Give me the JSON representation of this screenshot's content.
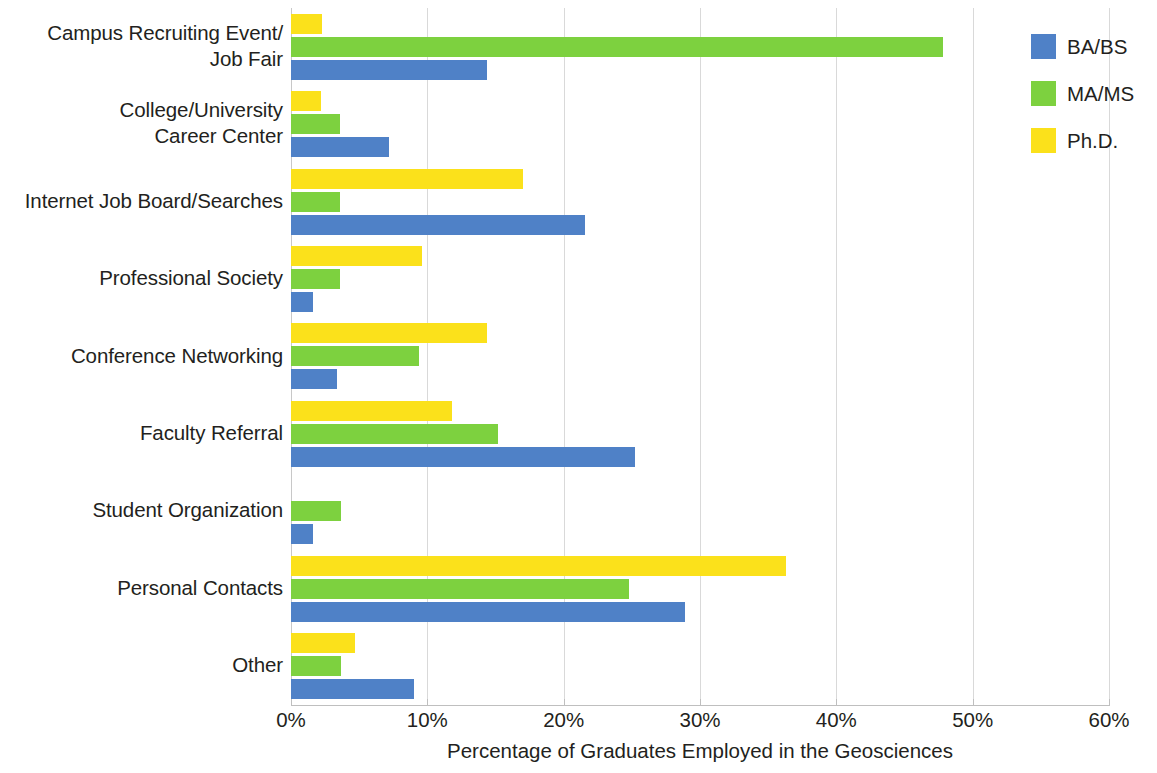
{
  "chart_data": {
    "type": "bar",
    "orientation": "horizontal",
    "title": "",
    "xlabel": "Percentage of Graduates Employed in the Geosciences",
    "ylabel": "",
    "xlim": [
      0,
      60
    ],
    "xticks": [
      "0%",
      "10%",
      "20%",
      "30%",
      "40%",
      "50%",
      "60%"
    ],
    "xtick_values": [
      0,
      10,
      20,
      30,
      40,
      50,
      60
    ],
    "grid": true,
    "legend_position": "right",
    "categories": [
      "Campus Recruiting Event/\nJob Fair",
      "College/University\nCareer Center",
      "Internet Job Board/Searches",
      "Professional Society",
      "Conference Networking",
      "Faculty Referral",
      "Student Organization",
      "Personal Contacts",
      "Other"
    ],
    "category_lines": [
      [
        "Campus Recruiting Event/",
        "Job Fair"
      ],
      [
        "College/University",
        "Career Center"
      ],
      [
        "Internet Job Board/Searches"
      ],
      [
        "Professional Society"
      ],
      [
        "Conference Networking"
      ],
      [
        "Faculty Referral"
      ],
      [
        "Student Organization"
      ],
      [
        "Personal Contacts"
      ],
      [
        "Other"
      ]
    ],
    "series": [
      {
        "name": "BA/BS",
        "color": "#4f81c7",
        "values": [
          14.4,
          7.2,
          21.6,
          1.6,
          3.4,
          25.2,
          1.6,
          28.9,
          9.0
        ]
      },
      {
        "name": "MA/MS",
        "color": "#7dd13f",
        "values": [
          47.8,
          3.6,
          3.6,
          3.6,
          9.4,
          15.2,
          3.7,
          24.8,
          3.7
        ]
      },
      {
        "name": "Ph.D.",
        "color": "#fbe11b",
        "values": [
          2.3,
          2.2,
          17.0,
          9.6,
          14.4,
          11.8,
          0,
          36.3,
          4.7
        ]
      }
    ]
  },
  "legend": {
    "items": [
      {
        "label": "BA/BS",
        "color": "#4f81c7"
      },
      {
        "label": "MA/MS",
        "color": "#7dd13f"
      },
      {
        "label": "Ph.D.",
        "color": "#fbe11b"
      }
    ]
  }
}
